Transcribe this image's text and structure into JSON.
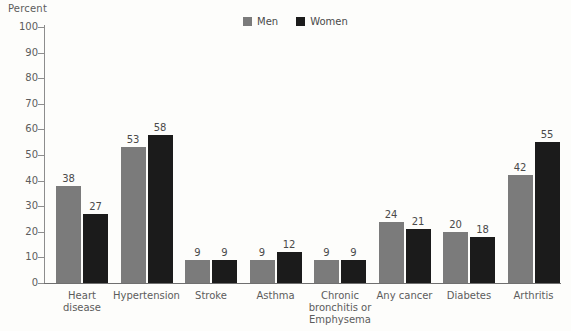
{
  "chart_data": {
    "type": "bar",
    "title": "",
    "ylabel": "Percent",
    "xlabel": "",
    "ylim": [
      0,
      100
    ],
    "ytick_step": 10,
    "grid": false,
    "legend_position": "top-center",
    "categories": [
      "Heart\ndisease",
      "Hypertension",
      "Stroke",
      "Asthma",
      "Chronic\nbronchitis or\nEmphysema",
      "Any cancer",
      "Diabetes",
      "Arthritis"
    ],
    "yticks": [
      "0",
      "10",
      "20",
      "30",
      "40",
      "50",
      "60",
      "70",
      "80",
      "90",
      "100"
    ],
    "series": [
      {
        "name": "Men",
        "color": "#7b7b7b",
        "values": [
          38,
          53,
          9,
          9,
          9,
          24,
          20,
          42
        ]
      },
      {
        "name": "Women",
        "color": "#1b1b1b",
        "values": [
          27,
          58,
          9,
          12,
          9,
          21,
          18,
          55
        ]
      }
    ]
  },
  "legend": {
    "entries": [
      {
        "label": "Men",
        "color": "#7b7b7b"
      },
      {
        "label": "Women",
        "color": "#1b1b1b"
      }
    ]
  }
}
